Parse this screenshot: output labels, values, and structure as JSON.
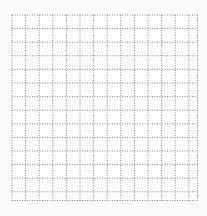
{
  "canvas": {
    "width": 207,
    "height": 216,
    "background": "#fcfcfb"
  },
  "grid": {
    "left": 12,
    "top": 15,
    "cell_size": 13.6,
    "full_cols": 13,
    "full_rows": 13,
    "last_col_width": 8.7,
    "last_row_height": 8.7,
    "line_color": "#858585",
    "line_width": 1,
    "dash_pattern": "1 1.5",
    "cell_fill": "#ffffff"
  }
}
